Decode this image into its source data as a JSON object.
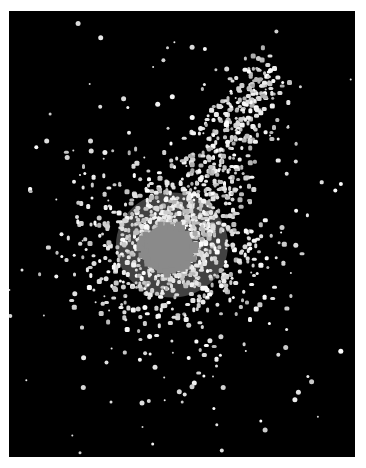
{
  "image": {
    "description": "Grayscale scatter of bright points on black forming a comet-shaped cloud with a mid-gray core",
    "background_color": "#000000",
    "page_color": "#ffffff",
    "frame": {
      "x": 9,
      "y": 11,
      "width": 346,
      "height": 446
    },
    "core": {
      "cx": 168,
      "cy": 249,
      "rx": 26,
      "ry": 24,
      "color": "#8a8a8a"
    },
    "halo": {
      "cx": 172,
      "cy": 245,
      "rx": 80,
      "ry": 75,
      "color": "#e6e6e6"
    },
    "plume": {
      "from": [
        172,
        245
      ],
      "to": [
        262,
        70
      ],
      "width": 55
    },
    "dot_color": "#f2f2f2",
    "dot_count": 1400,
    "seed": 7
  }
}
